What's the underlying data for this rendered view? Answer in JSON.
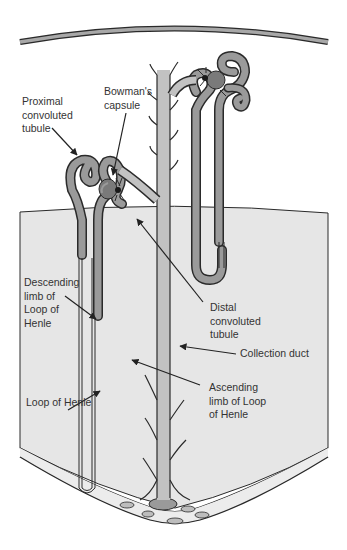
{
  "diagram": {
    "colors": {
      "background": "#ffffff",
      "medulla": "#e6e6e6",
      "tubule_fill": "#9a9a9a",
      "duct_fill": "#c2c2c2",
      "glomerulus": "#7a7a7a",
      "outline": "#2a2a2a",
      "text": "#333333"
    },
    "labels": {
      "proximal": "Proximal\nconvoluted\ntubule",
      "bowmans": "Bowman's\ncapsule",
      "descending": "Descending\nlimb of\nLoop of\nHenle",
      "distal": "Distal\nconvoluted\ntubule",
      "collection": "Collection duct",
      "loop": "Loop of Henle",
      "ascending": "Ascending\nlimb of Loop\nof Henle"
    }
  }
}
